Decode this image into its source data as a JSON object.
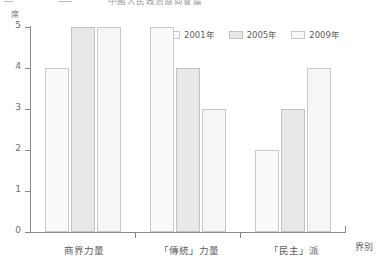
{
  "title": {
    "text": "中國人民政治協商會議",
    "truncated": true
  },
  "axes": {
    "y_unit": "席",
    "x_title": "界別",
    "y_ticks": [
      "0",
      "1",
      "2",
      "3",
      "4",
      "5"
    ]
  },
  "legend": {
    "items": [
      {
        "label": "2001年",
        "color": "#fafafa",
        "icon": "legend-swatch-icon"
      },
      {
        "label": "2005年",
        "color": "#e8e8e8",
        "icon": "legend-swatch-icon"
      },
      {
        "label": "2009年",
        "color": "#f8f8f8",
        "icon": "legend-swatch-icon"
      }
    ]
  },
  "chart_data": {
    "type": "bar",
    "title": "中國人民政治協商會議",
    "xlabel": "界別",
    "ylabel": "席",
    "ylim": [
      0,
      5
    ],
    "yticks": [
      0,
      1,
      2,
      3,
      4,
      5
    ],
    "grid": false,
    "legend_position": "top-right",
    "categories": [
      "商界力量",
      "「傳統」力量",
      "「民主」派"
    ],
    "series": [
      {
        "name": "2001年",
        "color": "#fafafa",
        "values": [
          4,
          5,
          2
        ]
      },
      {
        "name": "2005年",
        "color": "#e8e8e8",
        "values": [
          5,
          4,
          3
        ]
      },
      {
        "name": "2009年",
        "color": "#f8f8f8",
        "values": [
          5,
          3,
          4
        ]
      }
    ]
  }
}
